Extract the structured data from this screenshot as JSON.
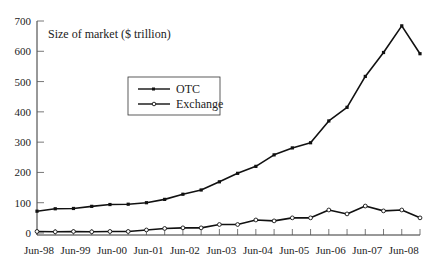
{
  "chart_data": {
    "type": "line",
    "title": "",
    "ylabel": "Size of market ($ trillion)",
    "xlabel": "",
    "ylim": [
      0,
      700
    ],
    "yticks": [
      0,
      100,
      200,
      300,
      400,
      500,
      600,
      700
    ],
    "grid": false,
    "legend_position": "upper-left-center (boxed)",
    "x": [
      "Jun-98",
      "Dec-98",
      "Jun-99",
      "Dec-99",
      "Jun-00",
      "Dec-00",
      "Jun-01",
      "Dec-01",
      "Jun-02",
      "Dec-02",
      "Jun-03",
      "Dec-03",
      "Jun-04",
      "Dec-04",
      "Jun-05",
      "Dec-05",
      "Jun-06",
      "Dec-06",
      "Jun-07",
      "Dec-07",
      "Jun-08",
      "Dec-08"
    ],
    "xtick_labels": [
      "Jun-98",
      "Jun-99",
      "Jun-00",
      "Jun-01",
      "Jun-02",
      "Jun-03",
      "Jun-04",
      "Jun-05",
      "Jun-06",
      "Jun-07",
      "Jun-08"
    ],
    "series": [
      {
        "name": "OTC",
        "marker": "filled-square",
        "color": "#111111",
        "values": [
          72,
          80,
          81,
          88,
          94,
          95,
          100,
          111,
          128,
          142,
          169,
          197,
          220,
          258,
          281,
          298,
          370,
          415,
          517,
          596,
          684,
          592
        ]
      },
      {
        "name": "Exchange",
        "marker": "open-circle",
        "color": "#111111",
        "values": [
          5,
          4,
          5,
          4,
          5,
          5,
          10,
          15,
          17,
          17,
          28,
          28,
          43,
          40,
          50,
          50,
          76,
          63,
          89,
          73,
          76,
          50
        ]
      }
    ]
  }
}
